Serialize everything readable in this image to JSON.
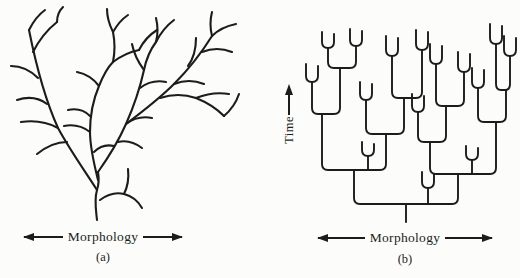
{
  "page": {
    "background": "#fcfcfa",
    "ink": "#1c1c1c"
  },
  "panel_a": {
    "caption": "(a)",
    "axis_label": "Morphology",
    "description": "freeform naturalistic branching tree",
    "strokes": [
      "M92,218 C91,208 89,198 92,188 C94,182 94,176 93,170",
      "M92,188 C82,172 66,150 53,126 C43,104 32,68 24,28",
      "M53,126 C42,120 30,118 16,120",
      "M42,102 C34,96 24,94 12,98",
      "M62,140 C52,140 42,144 32,152",
      "M28,50 C34,38 42,28 52,20",
      "M33,76 C25,68 16,64 6,64",
      "M24,28 C28,20 33,13 40,8",
      "M93,178 C89,162 85,146 85,130 C85,114 88,98 94,84 C98,74 102,66 108,60",
      "M94,84 C88,76 82,72 72,70",
      "M85,130 C77,124 69,122 59,124",
      "M85,114 C79,108 72,106 63,108",
      "M108,60 C110,50 110,40 108,30",
      "M108,30 C104,22 102,15 102,7",
      "M108,30 C112,23 117,17 123,13",
      "M108,60 C116,54 124,50 134,48",
      "M134,48 C138,40 144,33 152,28",
      "M93,170 C103,156 113,140 121,122 C129,104 135,86 139,68 C141,58 145,48 151,40",
      "M121,122 C129,116 137,114 147,116",
      "M135,86 C143,80 151,78 161,80",
      "M139,68 C133,60 129,52 127,42",
      "M151,40 C155,32 161,24 169,18",
      "M151,40 C153,32 153,24 151,16",
      "M113,140 C121,138 129,140 137,146",
      "M121,122 C137,110 155,96 169,82 C183,68 197,50 207,34",
      "M169,82 C179,78 189,78 199,82",
      "M197,50 C207,46 217,46 227,50",
      "M183,64 C189,56 191,46 191,36",
      "M207,34 C213,28 221,24 231,22",
      "M207,34 C205,26 205,18 207,10",
      "M155,96 C167,92 179,92 191,96 C201,100 211,106 219,114",
      "M191,96 C201,92 212,90 224,92",
      "M219,114 C226,108 231,101 234,92",
      "M89,150 C95,144 101,142 109,144",
      "M52,20 C52,14 54,9 58,5",
      "M95,198 C103,192 111,190 119,192 C127,194 133,199 137,206",
      "M119,192 C123,184 124,176 123,167"
    ]
  },
  "panel_b": {
    "caption": "(b)",
    "axis_label": "Morphology",
    "time_label": "Time",
    "description": "cladogram-style tree with rounded right-angle branches",
    "strokes": [
      "M106,202 V220",
      "M54,168 V196 Q54,202 60,202 H152 Q158,202 158,196 V172",
      "M22,112 V162 Q22,168 28,168 H80 Q86,168 86,162 V132",
      "M130,140 V166 Q130,172 136,172 H190 Q196,172 196,166 V120",
      "M12,80 V106 Q12,112 18,112 H34 Q40,112 40,106 V66",
      "M66,98 V126 Q66,132 72,132 H98 Q104,132 104,126 V96",
      "M118,110 V134 Q118,140 124,140 H140 Q146,140 146,134 V104",
      "M178,86 V114 Q178,120 184,120 H200 Q206,120 206,114 V88",
      "M28,46 V60 Q28,66 34,66 H50 Q56,66 56,60 V44",
      "M92,54 V90 Q92,96 98,96 H116 Q122,96 122,90 V48",
      "M136,62 V98 Q136,104 142,104 H158 Q164,104 164,98 V70",
      "M196,42 V82 Q196,88 201,88 H205 Q210,88 210,82 V54",
      "M128,202 V186",
      "M122,170 V180 Q122,186 128,186 Q134,186 134,180 V172",
      "M172,172 V158",
      "M166,144 V152 Q166,158 172,158 Q178,158 178,152 V146",
      "M68,168 V154",
      "M62,140 V148 Q62,154 68,154 Q74,154 74,148 V142",
      "M6,62 V74 Q6,80 12,80 Q18,80 18,74 V64",
      "M22,30 V40 Q22,46 28,46 Q34,46 34,40 V32",
      "M50,27 V38 Q50,44 56,44 Q62,44 62,38 V29",
      "M60,80 V92 Q60,98 66,98 Q72,98 72,92 V82",
      "M86,34 V48 Q86,54 92,54 Q98,54 98,48 V36",
      "M116,28 V42 Q116,48 122,48 Q128,48 128,42 V30",
      "M112,92 V104 Q112,110 118,110 Q124,110 124,104 V94",
      "M130,42 V56 Q130,62 136,62 Q142,62 142,56 V44",
      "M158,50 V64 Q158,70 164,70 Q170,70 170,64 V52",
      "M172,66 V80 Q172,86 178,86 Q184,86 184,80 V68",
      "M190,22 V36 Q190,42 196,42 Q202,42 202,36 V24",
      "M204,34 V48 Q204,54 210,54 Q216,54 216,48 V36"
    ]
  }
}
